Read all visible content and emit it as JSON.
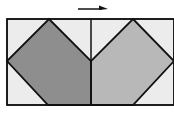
{
  "diagram": {
    "type": "quilt-block-fold",
    "width": 174,
    "height": 128,
    "colors": {
      "background": "#ffffff",
      "light_fill": "#ececec",
      "left_diamond_fill": "#8e8e8e",
      "right_diamond_fill": "#b8b8b8",
      "stroke": "#111111"
    },
    "arrow": {
      "direction": "right",
      "x1": 78,
      "y1": 9,
      "x2": 107,
      "y2": 9
    },
    "outer_rect": {
      "x": 7,
      "y": 19,
      "w": 167,
      "h": 86
    },
    "center_divider": {
      "x": 91,
      "y1": 19,
      "y2": 105
    },
    "shapes": [
      {
        "name": "left-diamond",
        "points": "49,19 91,61 91,105 48,105 7,61"
      },
      {
        "name": "right-diamond",
        "points": "133,19 174,61 133,105 91,105 91,61"
      }
    ]
  }
}
